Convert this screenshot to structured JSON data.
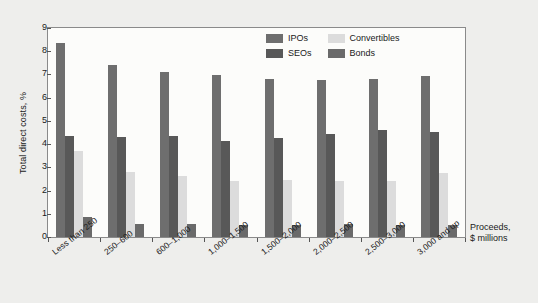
{
  "chart_data": {
    "type": "bar",
    "title": "",
    "subtitle": "",
    "xlabel": "Proceeds, $ millions",
    "ylabel": "Total direct costs, %",
    "ylim": [
      0,
      9
    ],
    "ytick_labels": [
      "9",
      "8",
      "7",
      "6",
      "5",
      "4",
      "3",
      "2",
      "1",
      "0"
    ],
    "ytick_values": [
      9,
      8,
      7,
      6,
      5,
      4,
      3,
      2,
      1,
      0
    ],
    "grid": false,
    "legend_position": "top-right",
    "categories": [
      "Less than 250",
      "250–600",
      "600–1,000",
      "1,000–1,500",
      "1,500–2,000",
      "2,000–2,500",
      "2,500–3,000",
      "3,000 and up"
    ],
    "series": [
      {
        "name": "IPOs",
        "color": "#6e6e6e",
        "values": [
          8.35,
          7.4,
          7.1,
          6.97,
          6.8,
          6.75,
          6.8,
          6.93
        ]
      },
      {
        "name": "SEOs",
        "color": "#585858",
        "values": [
          4.37,
          4.32,
          4.37,
          4.15,
          4.28,
          4.45,
          4.62,
          4.53
        ]
      },
      {
        "name": "Convertibles",
        "color": "#dcdcdc",
        "values": [
          3.72,
          2.8,
          2.62,
          2.42,
          2.45,
          2.42,
          2.42,
          2.76
        ]
      },
      {
        "name": "Bonds",
        "color": "#6a6a6a",
        "values": [
          0.87,
          0.58,
          0.58,
          0.5,
          0.53,
          0.58,
          0.5,
          0.5
        ]
      }
    ]
  },
  "legend": {
    "entries": [
      {
        "label": "IPOs",
        "color": "#6e6e6e"
      },
      {
        "label": "Convertibles",
        "color": "#dcdcdc"
      },
      {
        "label": "SEOs",
        "color": "#585858"
      },
      {
        "label": "Bonds",
        "color": "#6a6a6a"
      }
    ]
  },
  "axis_titles": {
    "y": "Total direct costs, %",
    "x_line1": "Proceeds,",
    "x_line2": "$ millions"
  },
  "colors": {
    "page_background": "#eeeeec",
    "plot_background": "#fcfcfa",
    "frame": "#8a8a8a",
    "text": "#1a1a1a"
  }
}
